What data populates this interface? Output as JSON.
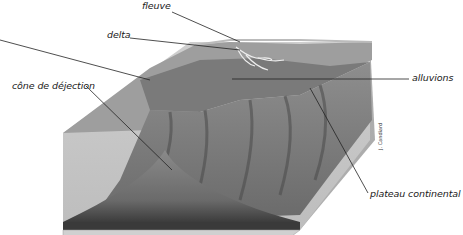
{
  "diagram": {
    "type": "geological block diagram",
    "title_fragment": "g",
    "labels": {
      "fleuve": "fleuve",
      "delta": "delta",
      "alluvions": "alluvions",
      "cone": "cône de déjection",
      "plateau": "plateau continental"
    },
    "credit": "J. Candiard",
    "colors": {
      "background": "#ffffff",
      "block_top": "#9a9a9a",
      "block_front": "#c4c4c4",
      "block_side": "#b0b0b0",
      "canyon_dark": "#5a5a5a",
      "sediment": "#3a3a3a",
      "leader_line": "#222222"
    }
  }
}
